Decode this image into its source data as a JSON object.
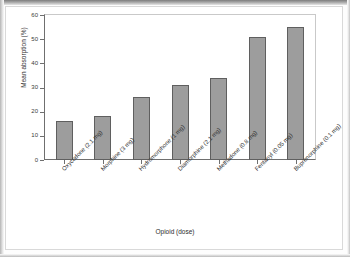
{
  "chart_data": {
    "type": "bar",
    "title": "",
    "xlabel": "Opioid (dose)",
    "ylabel": "Mean absorption (%)",
    "ylim": [
      0,
      60
    ],
    "yticks": [
      0,
      10,
      20,
      30,
      40,
      50,
      60
    ],
    "grid": false,
    "legend": null,
    "bar_color": "#9d9d9d",
    "bar_edge_color": "#5f5f5f",
    "categories": [
      "Oxycodone (2.1 mg)",
      "Morphine (3 mg)",
      "Hydromorphone (1 mg)",
      "Diamorphine (2.1 mg)",
      "Methadone (0.8 mg)",
      "Fentanyl (0.05 mg)",
      "Buprenorphine (0.1 mg)"
    ],
    "values": [
      16,
      18,
      26,
      31,
      34,
      51,
      55
    ]
  }
}
